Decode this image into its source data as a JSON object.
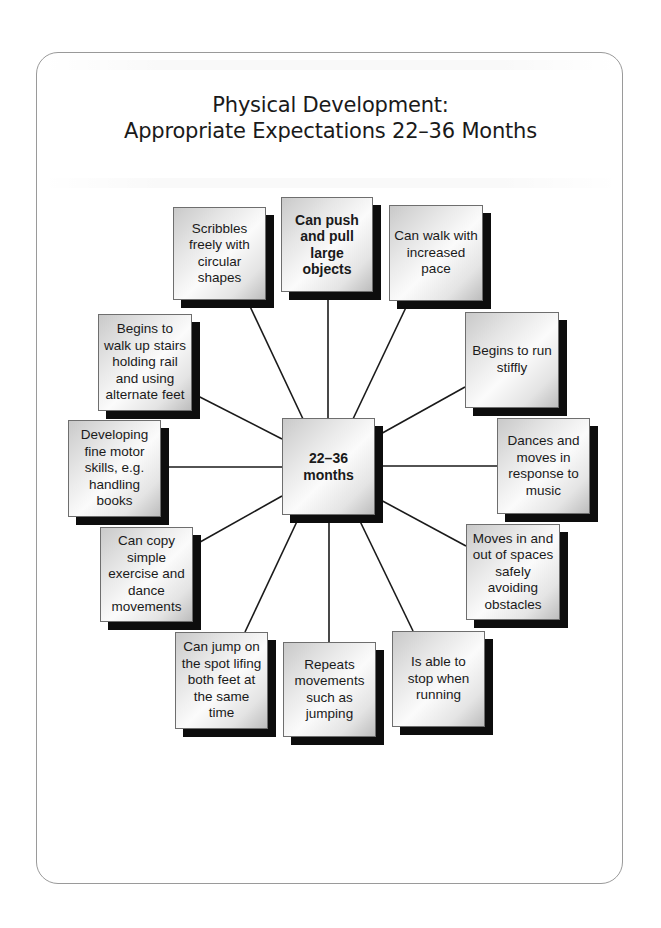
{
  "diagram": {
    "title_line1": "Physical Development:",
    "title_line2": "Appropriate Expectations 22–36 Months",
    "center": {
      "label": "22–36\nmonths"
    },
    "nodes": [
      {
        "id": "scribbles",
        "label": "Scribbles freely with circular shapes"
      },
      {
        "id": "push-pull",
        "label": "Can push and pull large objects",
        "bold": true
      },
      {
        "id": "walk-pace",
        "label": "Can walk with increased pace"
      },
      {
        "id": "run-stiffly",
        "label": "Begins to run stiffly"
      },
      {
        "id": "dances",
        "label": "Dances and moves in response to music"
      },
      {
        "id": "moves-spaces",
        "label": "Moves in and out of spaces safely avoiding obstacles"
      },
      {
        "id": "stop-running",
        "label": "Is able to stop when running"
      },
      {
        "id": "repeats",
        "label": "Repeats movements such as jumping"
      },
      {
        "id": "jump-spot",
        "label": "Can jump on the spot lifing both feet at the same time"
      },
      {
        "id": "copy-exercise",
        "label": "Can copy simple exercise and dance movements"
      },
      {
        "id": "fine-motor",
        "label": "Developing fine motor skills, e.g. handling books"
      },
      {
        "id": "stairs",
        "label": "Begins to walk up stairs holding rail and using alternate feet"
      }
    ]
  }
}
